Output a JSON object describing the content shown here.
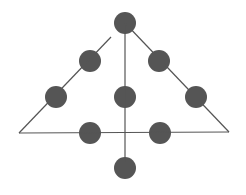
{
  "diagram": {
    "colors": {
      "background": "#ffffff",
      "dot": "#555555",
      "line": "#555555"
    },
    "dot_radius": 11,
    "dots": [
      {
        "x": 125,
        "y": 23
      },
      {
        "x": 90,
        "y": 61
      },
      {
        "x": 159,
        "y": 61
      },
      {
        "x": 56,
        "y": 97
      },
      {
        "x": 125,
        "y": 97
      },
      {
        "x": 196,
        "y": 97
      },
      {
        "x": 90,
        "y": 133
      },
      {
        "x": 160,
        "y": 133
      },
      {
        "x": 125,
        "y": 168
      }
    ],
    "lines": [
      {
        "name": "left-side",
        "x1": 111,
        "y1": 37,
        "x2": 19,
        "y2": 133
      },
      {
        "name": "right-side",
        "x1": 125,
        "y1": 23,
        "x2": 229,
        "y2": 132
      },
      {
        "name": "base",
        "x1": 19,
        "y1": 133,
        "x2": 229,
        "y2": 132
      },
      {
        "name": "vertical",
        "x1": 125,
        "y1": 25,
        "x2": 125,
        "y2": 162
      }
    ]
  }
}
